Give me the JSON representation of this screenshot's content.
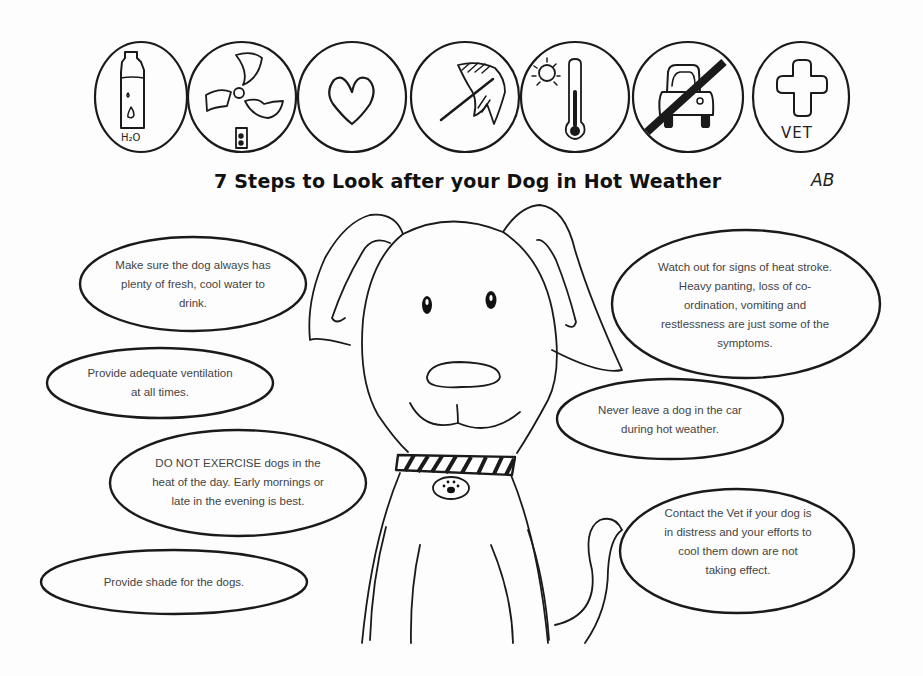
{
  "title": "7 Steps to Look after your Dog in Hot Weather",
  "initials": "AB",
  "icons": [
    {
      "name": "water-bottle-icon",
      "label": "H₂O"
    },
    {
      "name": "fan-icon",
      "label": ""
    },
    {
      "name": "heart-icon",
      "label": ""
    },
    {
      "name": "umbrella-icon",
      "label": ""
    },
    {
      "name": "thermometer-sun-icon",
      "label": ""
    },
    {
      "name": "no-car-icon",
      "label": ""
    },
    {
      "name": "vet-cross-icon",
      "label": "VET"
    }
  ],
  "tips": {
    "water": "Make sure the dog always has plenty of fresh, cool water to drink.",
    "ventilation": "Provide adequate ventilation at all times.",
    "exercise": "DO NOT EXERCISE dogs in the heat of the day. Early mornings or late in the evening is best.",
    "shade": "Provide shade for the dogs.",
    "heatstroke": "Watch out for signs of heat stroke. Heavy panting, loss of co-ordination, vomiting and restlessness are just some of the symptoms.",
    "car": "Never leave a dog in the car during hot weather.",
    "vet": "Contact the Vet if your dog is in distress and your efforts to cool them down are not taking effect."
  }
}
